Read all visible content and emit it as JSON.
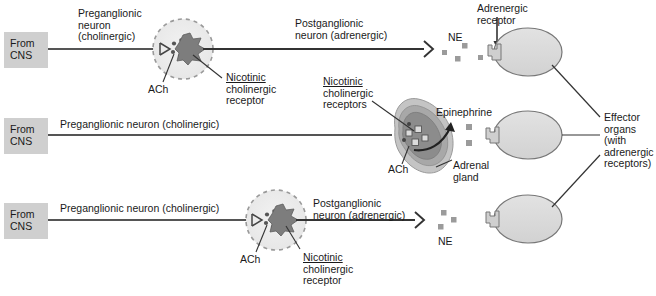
{
  "figure": {
    "background_color": "#ffffff",
    "ink_color": "#1a1a1a",
    "cns_box_color": "#cfcfcf",
    "ganglion_fill": "#ebebeb",
    "ganglion_dash_color": "#9a9a9a",
    "synapse_dark": "#7d7d7d",
    "organ_fill": "#dcdcdc",
    "adrenal_outer": "#c4c4c4",
    "adrenal_mid": "#a8a8a8",
    "adrenal_inner": "#8c8c8c",
    "neurotransmitter_square": "#9b9b9b"
  },
  "rows": [
    {
      "id": "row-1-sympathetic-typical",
      "cns_label": "From\nCNS",
      "preganglionic_label": "Preganglionic\nneuron\n(cholinergic)",
      "ach_label": "ACh",
      "nicotinic_label": "Nicotinic\ncholinergic\nreceptor",
      "postganglionic_label": "Postganglionic\nneuron (adrenergic)",
      "transmitter_label": "NE",
      "receptor_label": "Adrenergic\nreceptor"
    },
    {
      "id": "row-2-adrenal-medulla",
      "cns_label": "From\nCNS",
      "preganglionic_label": "Preganglionic neuron (cholinergic)",
      "ach_label": "ACh",
      "nicotinic_label": "Nicotinic\ncholinergic\nreceptors",
      "hormone_label": "Epinephrine",
      "gland_label": "Adrenal\ngland"
    },
    {
      "id": "row-3-sympathetic-typical",
      "cns_label": "From\nCNS",
      "preganglionic_label": "Preganglionic neuron (cholinergic)",
      "ach_label": "ACh",
      "nicotinic_label": "Nicotinic\ncholinergic\nreceptor",
      "postganglionic_label": "Postganglionic\nneuron (adrenergic)",
      "transmitter_label": "NE"
    }
  ],
  "effector": {
    "label": "Effector\norgans\n(with\nadrenergic\nreceptors)"
  },
  "text_fragments": {
    "nicotinic_word": "Nicotinic",
    "cholinergic_word": "cholinergic",
    "receptor_word": "receptor",
    "receptors_word": "receptors",
    "adrenergic_word": "Adrenergic",
    "receptor_word_2": "receptor",
    "adrenal_word": "Adrenal",
    "gland_word": "gland",
    "effector_word": "Effector",
    "organs_word": "organs",
    "with_word": "(with",
    "adrenergic_word_2": "adrenergic",
    "receptors_word_2": "receptors)",
    "pre_word_1": "Preganglionic",
    "neuron_word": "neuron",
    "cholinergic_paren": "(cholinergic)",
    "post_word_1": "Postganglionic",
    "post_word_2": "neuron (adrenergic)",
    "pre_full": "Preganglionic neuron (cholinergic)",
    "ne": "NE",
    "ach": "ACh",
    "epinephrine": "Epinephrine",
    "from": "From",
    "cns": "CNS"
  }
}
